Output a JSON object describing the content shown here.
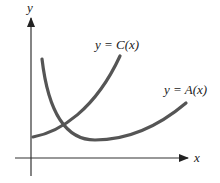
{
  "diagram": {
    "axes": {
      "x_label": "x",
      "y_label": "y"
    },
    "curves": [
      {
        "id": "C",
        "label": "y = C(x)",
        "color": "#555555"
      },
      {
        "id": "A",
        "label": "y = A(x)",
        "color": "#555555"
      }
    ]
  }
}
